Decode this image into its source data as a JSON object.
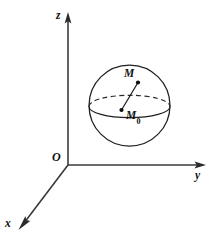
{
  "figure": {
    "background_color": "#ffffff",
    "line_color": "#1f1f1f",
    "axis_color": "#3a3a3a"
  },
  "axes": {
    "z": {
      "label": "z",
      "icon": "arrow-up-icon",
      "origin": {
        "x": 68,
        "y": 165
      },
      "tip": {
        "x": 68,
        "y": 14
      }
    },
    "y": {
      "label": "y",
      "icon": "arrow-right-icon",
      "origin": {
        "x": 68,
        "y": 165
      },
      "tip": {
        "x": 205,
        "y": 165
      }
    },
    "x": {
      "label": "x",
      "icon": "arrow-down-left-icon",
      "origin": {
        "x": 68,
        "y": 165
      },
      "tip": {
        "x": 19,
        "y": 229
      }
    }
  },
  "origin": {
    "label": "O",
    "x": 68,
    "y": 165
  },
  "sphere": {
    "center": {
      "x": 129.5,
      "y": 105.5
    },
    "radius": 40.5,
    "equator": {
      "rx": 40.5,
      "ry": 11.2,
      "cy": 106.5,
      "back_arc_style": "dashed",
      "front_arc_style": "solid"
    }
  },
  "points": [
    {
      "label": "M",
      "subscript": "",
      "x": 138,
      "y": 82.5
    },
    {
      "label": "M",
      "subscript": "0",
      "x": 121.5,
      "y": 110
    }
  ],
  "radius_segment": {
    "from": {
      "x": 138,
      "y": 82.5
    },
    "to": {
      "x": 121.5,
      "y": 110
    }
  }
}
